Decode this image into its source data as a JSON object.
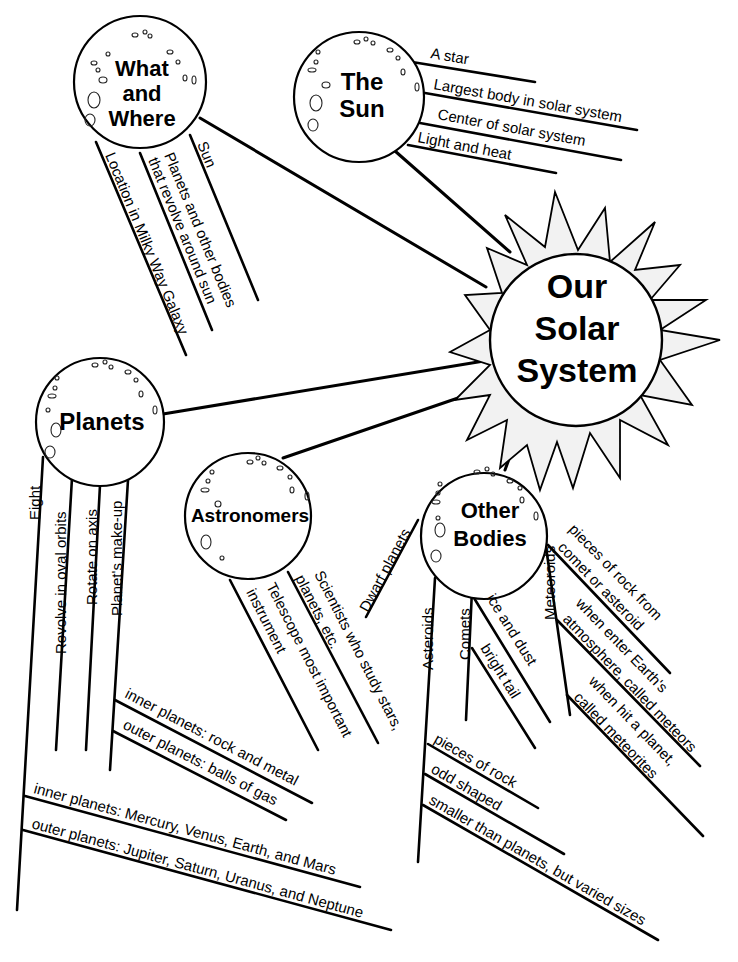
{
  "center": {
    "title_lines": [
      "Our",
      "Solar",
      "System"
    ],
    "color_stroke": "#000000",
    "color_fill": "#ffffff"
  },
  "nodes": {
    "what_where": {
      "title_lines": [
        "What",
        "and",
        "Where"
      ],
      "details": [
        "Sun",
        "Planets and other bodies",
        "that revolve around sun",
        "Location in Milky Way Galaxy"
      ]
    },
    "the_sun": {
      "title_lines": [
        "The",
        "Sun"
      ],
      "details": [
        "A star",
        "Largest body in solar system",
        "Center of solar system",
        "Light and heat"
      ]
    },
    "planets": {
      "title_lines": [
        "Planets"
      ],
      "details": [
        "Eight",
        "Revolve in oval orbits",
        "Rotate on axis",
        "Planet's make-up"
      ],
      "makeup": [
        "inner planets: rock and metal",
        "outer planets: balls of gas"
      ],
      "eight": [
        "inner planets: Mercury, Venus, Earth, and Mars",
        "outer planets: Jupiter, Saturn, Uranus, and Neptune"
      ]
    },
    "astronomers": {
      "title_lines": [
        "Astronomers"
      ],
      "details": [
        "Scientists who study stars,",
        "planets, etc.",
        "Telescope most important",
        "instrument"
      ]
    },
    "other_bodies": {
      "title_lines": [
        "Other",
        "Bodies"
      ],
      "details": [
        "Dwarf planets",
        "Asteroids",
        "Comets",
        "Meteoroids"
      ],
      "asteroids": [
        "pieces of rock",
        "odd shaped",
        "smaller than planets, but varied sizes"
      ],
      "comets": [
        "ice and dust",
        "bright tail"
      ],
      "meteoroids": [
        "pieces of rock from",
        "comet or asteroid",
        "when enter Earth's",
        "atmosphere, called meteors",
        "when hit a planet,",
        "called meteorites"
      ]
    }
  }
}
